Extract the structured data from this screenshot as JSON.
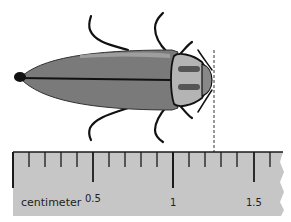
{
  "figure": {
    "ruler": {
      "unit_label": "centimeter",
      "tick_labels": [
        "0.5",
        "1",
        "1.5"
      ],
      "minor_divisions_per_half": 5,
      "colors": {
        "body": "#c6c6c6",
        "ticks": "#1a1a1a"
      }
    },
    "measurement_line": {
      "style": "dashed",
      "position_cm": 1.26
    },
    "colors": {
      "beetle_body": "#7a7a7a",
      "beetle_highlight": "#a8a8a8",
      "legs": "#111111"
    }
  }
}
